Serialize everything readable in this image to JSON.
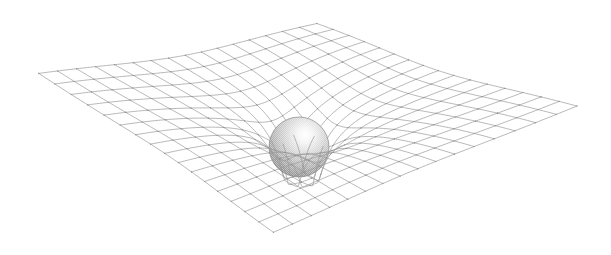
{
  "figure": {
    "title": "Spacetime curvature around a massive body",
    "background_color": "#ffffff",
    "width": 611,
    "height": 255
  },
  "grid": {
    "name": "spacetime-grid",
    "line_color": "#9a9a9a",
    "node_color": "#8d8d8d",
    "line_width": 0.7,
    "divisions_u": 16,
    "divisions_v": 16,
    "corner_left": [
      36,
      72
    ],
    "corner_top": [
      317,
      22
    ],
    "corner_right": [
      580,
      105
    ],
    "corner_bottom": [
      273,
      233
    ],
    "show_nodes": true,
    "node_radius": 0.55
  },
  "well": {
    "name": "gravity-well",
    "center_u": 0.5,
    "center_v": 0.5,
    "depth_px": 74,
    "radius": 0.235,
    "inner_pinch": 0.34,
    "vertical_scale": 1.0
  },
  "sphere": {
    "name": "massive-body",
    "center_x": 299,
    "center_y": 147,
    "radius": 30,
    "highlight_x": 306,
    "highlight_y": 134,
    "highlight_color": "#ffffff",
    "mid_color": "#cfcfcf",
    "shadow_color": "#8a8a8a",
    "rim_color": "#7a7a7a",
    "texture": "halftone-dither"
  },
  "chart_data": {
    "type": "surface",
    "title": "Spacetime curvature around a massive body",
    "xlabel": "",
    "ylabel": "",
    "grid_rows": 17,
    "grid_cols": 17,
    "well_center": [
      0.5,
      0.5
    ],
    "well_depth": 74,
    "well_radius": 0.235,
    "legend": [],
    "annotations": []
  }
}
